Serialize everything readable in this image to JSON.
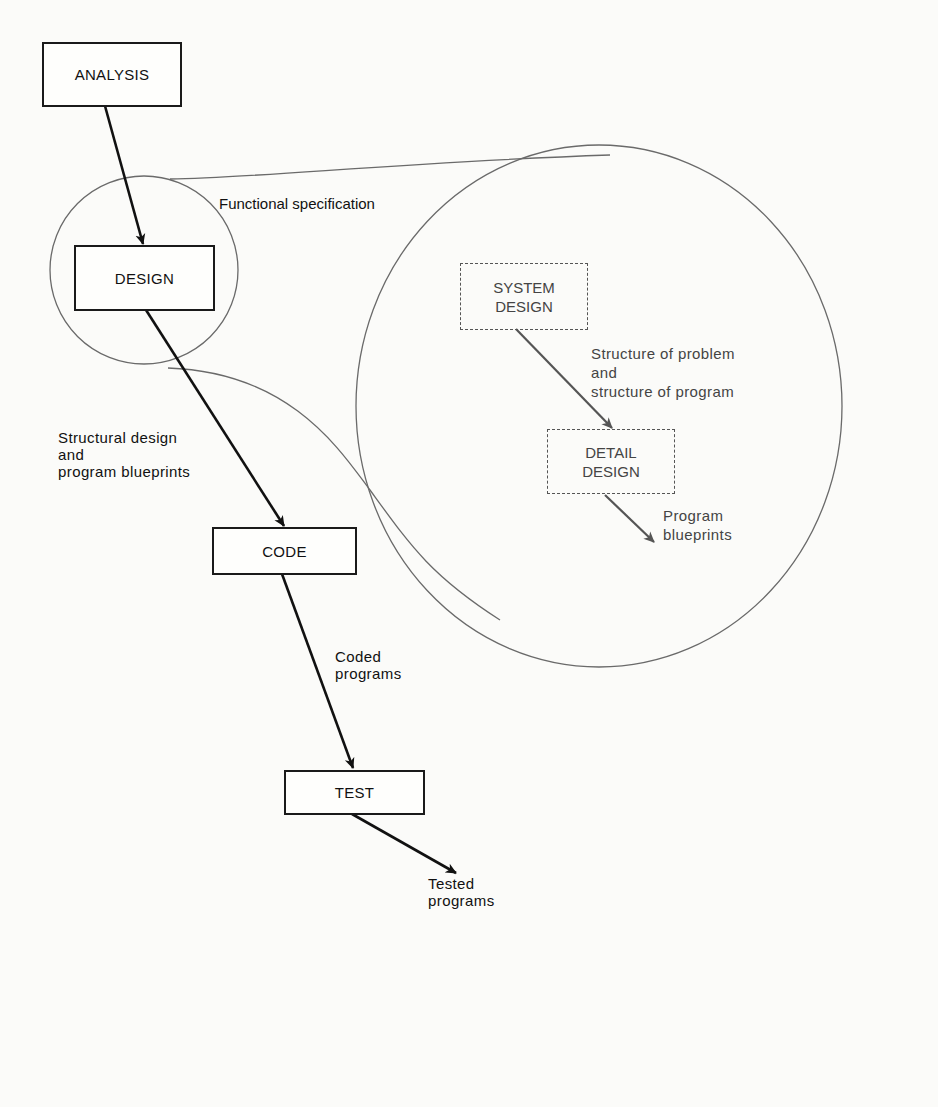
{
  "diagram": {
    "type": "process flow with exploded detail",
    "boxes": {
      "analysis": "ANALYSIS",
      "design": "DESIGN",
      "code": "CODE",
      "test": "TEST"
    },
    "detail_boxes": {
      "system_design": "SYSTEM\nDESIGN",
      "detail_design": "DETAIL\nDESIGN"
    },
    "labels": {
      "functional_spec": "Functional specification",
      "structural_design": "Structural design\nand\nprogram blueprints",
      "coded_programs": "Coded\nprograms",
      "tested_programs": "Tested\nprograms",
      "structure_problem": "Structure of problem\nand\nstructure of program",
      "program_blueprints": "Program\nblueprints"
    },
    "colors": {
      "main_line": "#111111",
      "detail_line": "#555555",
      "circle_line": "#6a6a6a"
    }
  }
}
